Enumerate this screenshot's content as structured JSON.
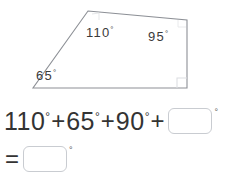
{
  "figure": {
    "shape_name": "quadrilateral",
    "stroke_color": "#8d9096",
    "right_angle_marker_color": "#d8dade",
    "angle_labels": [
      {
        "name": "angle-110",
        "value": "110",
        "degree_symbol": "°"
      },
      {
        "name": "angle-95",
        "value": "95",
        "degree_symbol": "°"
      },
      {
        "name": "angle-65",
        "value": "65",
        "degree_symbol": "°"
      }
    ]
  },
  "equation": {
    "line1": {
      "terms": [
        "110",
        "65",
        "90"
      ],
      "degree_symbol": "°",
      "plus": "+",
      "answer_placeholder": "",
      "answer_value": "",
      "answer_degree": "°"
    },
    "line2": {
      "equals": "=",
      "answer_placeholder": "",
      "answer_value": "",
      "answer_degree": "°"
    }
  }
}
